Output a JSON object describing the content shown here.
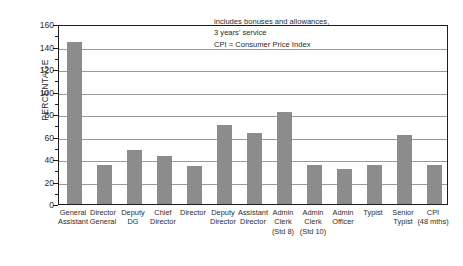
{
  "chart_data": {
    "type": "bar",
    "title": "",
    "xlabel": "",
    "ylabel": "PERCENTAGE",
    "ylim": [
      0,
      160
    ],
    "ytick_step": 20,
    "yticks": [
      0,
      20,
      40,
      60,
      80,
      100,
      120,
      140,
      160
    ],
    "ytick_labels": [
      "0",
      "20",
      "40",
      "60",
      "80",
      "100",
      "120",
      "140",
      "160"
    ],
    "grid": true,
    "legend": "none",
    "bar_color": "#8c8c8c",
    "frame_color": "#1c1c1c",
    "gridline_color": "#9a9a9a",
    "categories": [
      "General Assistant",
      "Director General",
      "Deputy DG",
      "Chief Director",
      "Director",
      "Deputy Director",
      "Assistant Director",
      "Admin Clerk (Std 8)",
      "Admin Clerk (Std 10)",
      "Admin Officer",
      "Typist",
      "Senior Typist",
      "CPI (48 mths)"
    ],
    "category_lines": [
      [
        "General",
        "Assistant"
      ],
      [
        "Director",
        "General"
      ],
      [
        "Deputy",
        "DG"
      ],
      [
        "Chief",
        "Director"
      ],
      [
        "Director"
      ],
      [
        "Deputy",
        "Director"
      ],
      [
        "Assistant",
        "Director"
      ],
      [
        "Admin",
        "Clerk",
        "(Std 8)"
      ],
      [
        "Admin",
        "Clerk",
        "(Std 10)"
      ],
      [
        "Admin",
        "Officer"
      ],
      [
        "Typist"
      ],
      [
        "Senior",
        "Typist"
      ],
      [
        "CPI",
        "(48 mths)"
      ]
    ],
    "values": [
      144,
      35,
      48,
      43,
      34,
      70,
      63,
      82,
      35,
      31,
      35,
      61,
      35
    ],
    "annotations": [
      "includes bonuses and allowances,",
      "3 years' service",
      "CPI = Consumer Price Index"
    ]
  }
}
